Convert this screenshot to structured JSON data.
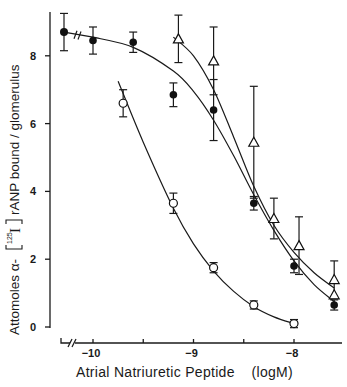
{
  "chart_data": {
    "type": "scatter",
    "title": "",
    "xlabel": "Atrial Natriuretic Peptide",
    "xlabel_unit": "(logM)",
    "ylabel": "Attomoles α-[125I] rANP bound / glomerulus",
    "xlim": [
      -10.3,
      -7.55
    ],
    "ylim": [
      0,
      9.5
    ],
    "x_ticks": [
      -10,
      -9.5,
      -9,
      -8.5,
      -8
    ],
    "x_tick_labels": [
      "-10",
      "",
      "-9",
      "",
      "-8"
    ],
    "y_ticks": [
      0,
      2,
      4,
      6,
      8
    ],
    "y_tick_labels": [
      "0",
      "2",
      "4",
      "6",
      "8"
    ],
    "x_axis_break": true,
    "grid": false,
    "legend": "none",
    "series": [
      {
        "name": "filled circles",
        "marker": "filled-circle",
        "control_point": {
          "y": 8.7,
          "err": 0.55
        },
        "x": [
          -10.0,
          -9.6,
          -9.2,
          -8.8,
          -8.4,
          -8.0,
          -7.6
        ],
        "y": [
          8.45,
          8.4,
          6.85,
          6.4,
          3.65,
          1.8,
          0.65
        ],
        "err": [
          0.4,
          0.3,
          0.35,
          0.9,
          0.2,
          0.2,
          0.15
        ]
      },
      {
        "name": "open circles",
        "marker": "open-circle",
        "x": [
          -9.7,
          -9.2,
          -8.8,
          -8.4,
          -8.0
        ],
        "y": [
          6.6,
          3.65,
          1.75,
          0.65,
          0.1
        ],
        "err": [
          0.4,
          0.3,
          0.15,
          0.12,
          0.12
        ]
      },
      {
        "name": "open triangles",
        "marker": "open-triangle",
        "x": [
          -9.15,
          -8.8,
          -8.4,
          -8.2,
          -7.95,
          -7.6,
          -7.6
        ],
        "y": [
          8.5,
          7.85,
          5.45,
          3.2,
          2.4,
          1.4,
          0.95
        ],
        "err": [
          0.7,
          1.0,
          1.65,
          0.6,
          0.85,
          0.55,
          0.0
        ]
      }
    ],
    "curves": [
      {
        "name": "filled fit",
        "x": [
          -10.0,
          -9.6,
          -9.2,
          -9.0,
          -8.8,
          -8.6,
          -8.4,
          -8.2,
          -8.0,
          -7.8,
          -7.6
        ],
        "y": [
          8.55,
          8.25,
          7.55,
          6.95,
          6.1,
          5.05,
          3.9,
          2.85,
          1.95,
          1.25,
          0.75
        ]
      },
      {
        "name": "open circles fit",
        "x": [
          -9.75,
          -9.5,
          -9.2,
          -9.0,
          -8.8,
          -8.6,
          -8.4,
          -8.2,
          -8.0
        ],
        "y": [
          7.25,
          5.45,
          3.5,
          2.45,
          1.65,
          1.05,
          0.6,
          0.3,
          0.1
        ]
      },
      {
        "name": "triangles fit",
        "x": [
          -9.2,
          -9.0,
          -8.8,
          -8.6,
          -8.4,
          -8.2,
          -8.0,
          -7.8,
          -7.6
        ],
        "y": [
          8.55,
          8.0,
          7.0,
          5.6,
          4.15,
          3.0,
          2.2,
          1.6,
          1.15
        ]
      }
    ]
  },
  "labels": {
    "xlabel": "Atrial Natriuretic Peptide",
    "xunit": "(logM)",
    "ylabel_pre": "Attomoles α-",
    "ylabel_iso": "125",
    "ylabel_I": "I",
    "ylabel_post": "rANP bound / glomerulus"
  }
}
